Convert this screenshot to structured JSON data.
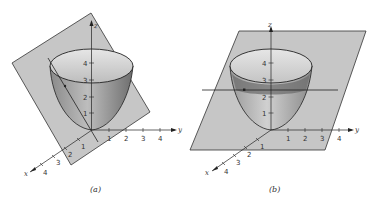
{
  "figures": [
    {
      "id": "a",
      "caption": "(a)",
      "plane": "tilted vertical plane through z-axis",
      "axes": {
        "x_label": "x",
        "y_label": "y",
        "z_label": "z",
        "x_ticks": [
          "1",
          "2",
          "3",
          "4"
        ],
        "y_ticks": [
          "1",
          "2",
          "3",
          "4"
        ],
        "z_ticks": [
          "1",
          "2",
          "3",
          "4"
        ]
      }
    },
    {
      "id": "b",
      "caption": "(b)",
      "plane": "horizontal plane",
      "axes": {
        "x_label": "x",
        "y_label": "y",
        "z_label": "z",
        "x_ticks": [
          "1",
          "2",
          "3",
          "4"
        ],
        "y_ticks": [
          "1",
          "2",
          "3",
          "4"
        ],
        "z_ticks": [
          "1",
          "2",
          "3",
          "4"
        ]
      }
    }
  ],
  "colors": {
    "plane": "#c6c6c6",
    "plane_edge": "#333333",
    "surface_light": "#d8d8d8",
    "surface_dark": "#7a7a7a",
    "line": "#222222"
  }
}
